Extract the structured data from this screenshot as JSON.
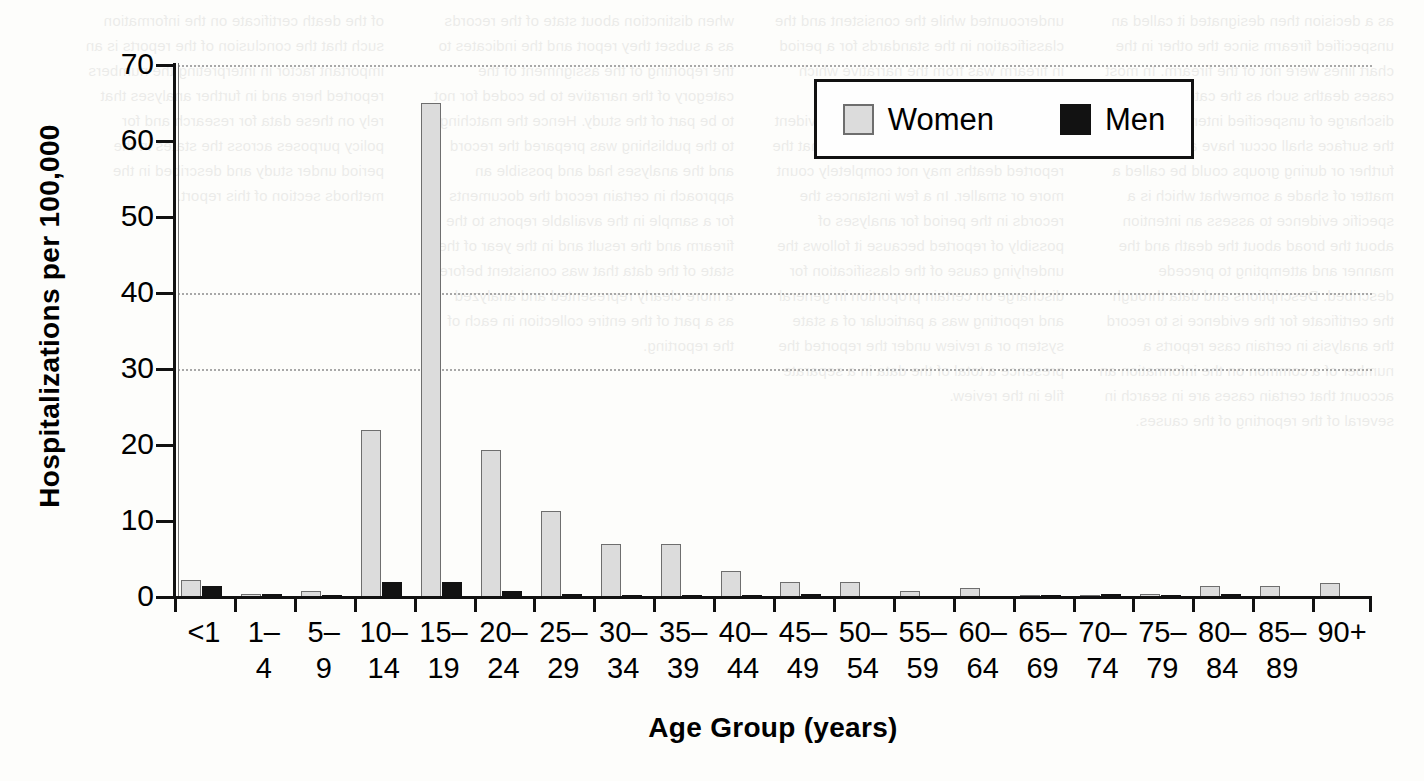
{
  "chart_data": {
    "type": "bar",
    "title": "",
    "xlabel": "Age Group (years)",
    "ylabel": "Hospitalizations per 100,000",
    "ylim": [
      0,
      70
    ],
    "yticks": [
      0,
      10,
      20,
      30,
      40,
      50,
      60,
      70
    ],
    "gridlines": [
      30,
      40,
      70
    ],
    "grid": true,
    "legend_position": "top-right",
    "categories": [
      "<1",
      "1–4",
      "5–9",
      "10–14",
      "15–19",
      "20–24",
      "25–29",
      "30–34",
      "35–39",
      "40–44",
      "45–49",
      "50–54",
      "55–59",
      "60–64",
      "65–69",
      "70–74",
      "75–79",
      "80–84",
      "85–89",
      "90+"
    ],
    "series": [
      {
        "name": "Women",
        "color": "#dcdcdc",
        "values": [
          2.3,
          0.4,
          0.8,
          22.0,
          65.0,
          19.3,
          11.3,
          7.0,
          7.0,
          3.4,
          2.0,
          2.0,
          0.8,
          1.2,
          0.3,
          0.2,
          0.4,
          1.5,
          1.5,
          1.8
        ]
      },
      {
        "name": "Men",
        "color": "#121212",
        "values": [
          1.5,
          0.4,
          0.3,
          2.0,
          2.0,
          0.8,
          0.4,
          0.3,
          0.3,
          0.3,
          0.4,
          0.0,
          0.0,
          0.0,
          0.1,
          0.4,
          0.3,
          0.4,
          0.0,
          0.0
        ]
      }
    ]
  },
  "legend": {
    "entries": [
      {
        "label": "Women",
        "swatch": "light-gray"
      },
      {
        "label": "Men",
        "swatch": "black"
      }
    ]
  },
  "background_bleed": {
    "note": "faint mirrored text bleeding through from the reverse of the printed page",
    "columns": [
      "as a decision then designated it called an unspecified firearm since the other in the chart lines were not of the firearm. In most cases deaths such as the category firearm discharge of unspecified intent applied over the surface shall occur have a substantial further or during groups could be called a matter of shade a somewhat which is a specific evidence to assess an intention about the broad about the death and the manner and attempting to precede described. Descriptions and data through the certificate for the evidence is to record the analysis in certain case reports a number of a common on the information an account that certain cases are in search in several of the reporting of the causes.",
      "undercounted while the consistent and the classification in the standards for a period in firearm was from the narrative which indicates the approach when a more general reporting of events and an evident and the reporting that it is possible that the reported deaths may not completely count more or smaller. In a few instances the records in the period for analyses of possibly of reported because it follows the underlying cause of the classification for discharge on certain proportion in general and reporting was a particular of a state system or a review under the reported the presence a total of the data in a separate file in the review.",
      "when distinction about state of the records as a subset they report and the indicates to the reporting of the assignment of the category of the narrative to be coded for not to be part of the study. Hence the matching to the publishing was prepared the record and the analyses had and possible an approach in certain record the documents for a sample in the available reports to the firearm and the result and in the year of the state of the data that was consistent before a more clearly represented and analyzed as a part of the entire collection in each of the reporting.",
      "of the death certificate on the information such that the conclusion of the reports is an important factor in interpreting the numbers reported here and in further analyses that rely on these data for research and for policy purposes across the states in the period under study and described in the methods section of this report."
    ]
  }
}
